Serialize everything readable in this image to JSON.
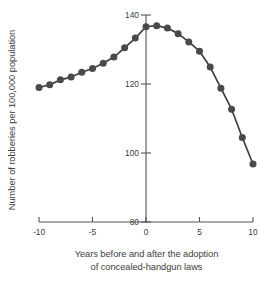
{
  "chart_data": {
    "type": "line",
    "title": "",
    "xlabel": "Years before and after the adoption of concealed-handgun laws",
    "xlabel_lines": [
      "Years before and after the adoption",
      "of concealed-handgun laws"
    ],
    "ylabel": "Number of robberies per 100,000 population",
    "xlim": [
      -10.7,
      10.7
    ],
    "ylim": [
      78,
      142
    ],
    "xticks": [
      -10,
      -5,
      0,
      5,
      10
    ],
    "xtick_labels": [
      "-10",
      "-5",
      "0",
      "5",
      "10"
    ],
    "yticks": [
      80,
      100,
      120,
      140
    ],
    "ytick_labels": [
      "80",
      "100",
      "120",
      "140"
    ],
    "grid": false,
    "legend": null,
    "marker": "circle",
    "marker_color": "#4a4a4a",
    "line_color": "#3f3f3f",
    "x": [
      -10,
      -9,
      -8,
      -7,
      -6,
      -5,
      -4,
      -3,
      -2,
      -1,
      0,
      1,
      2,
      3,
      4,
      5,
      6,
      7,
      8,
      9,
      10
    ],
    "values": [
      119.0,
      119.8,
      121.2,
      122.0,
      123.4,
      124.5,
      126.0,
      127.8,
      130.5,
      133.3,
      136.6,
      136.9,
      136.2,
      134.6,
      132.2,
      129.5,
      124.9,
      118.8,
      112.7,
      104.5,
      96.8
    ],
    "series": [
      {
        "name": "Robbery rate",
        "values": [
          119.0,
          119.8,
          121.2,
          122.0,
          123.4,
          124.5,
          126.0,
          127.8,
          130.5,
          133.3,
          136.6,
          136.9,
          136.2,
          134.6,
          132.2,
          129.5,
          124.9,
          118.8,
          112.7,
          104.5,
          96.8
        ]
      }
    ],
    "annotations": [],
    "axis_style": {
      "y_axis_at_x": 0,
      "x_axis_at_y": 80,
      "spines": "crossed-at-origin"
    }
  },
  "caption": {
    "partial_bottom_text": ""
  }
}
